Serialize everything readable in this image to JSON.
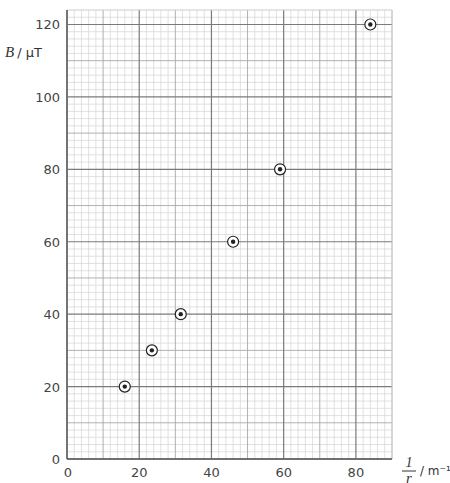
{
  "chart_data": {
    "type": "scatter",
    "title": "",
    "xlabel": "1/r / m⁻¹",
    "ylabel": "B / μT",
    "xlabel_parts": {
      "numerator": "1",
      "denominator": "r",
      "unit": "/ m⁻¹"
    },
    "ylabel_parts": {
      "variable": "B",
      "unit": "/ μT"
    },
    "xlim": [
      0,
      90
    ],
    "ylim": [
      0,
      124
    ],
    "x_ticks": [
      0,
      20,
      40,
      60,
      80
    ],
    "y_ticks": [
      0,
      20,
      40,
      60,
      80,
      100,
      120
    ],
    "grid": {
      "major": 20,
      "mid": 10,
      "minor": 2
    },
    "marker": "circled-dot",
    "series": [
      {
        "name": "B vs 1/r",
        "x": [
          16,
          23.5,
          31.5,
          46,
          59,
          84
        ],
        "y": [
          20,
          30,
          40,
          60,
          80,
          120
        ]
      }
    ],
    "legend": null
  },
  "layout": {
    "plot": {
      "left": 67,
      "right": 392,
      "top": 10,
      "bottom": 459
    },
    "colors": {
      "major": "#7a7a7a",
      "mid": "#a8a8a8",
      "minor": "#d4d4d4",
      "marker": "#222222"
    }
  }
}
